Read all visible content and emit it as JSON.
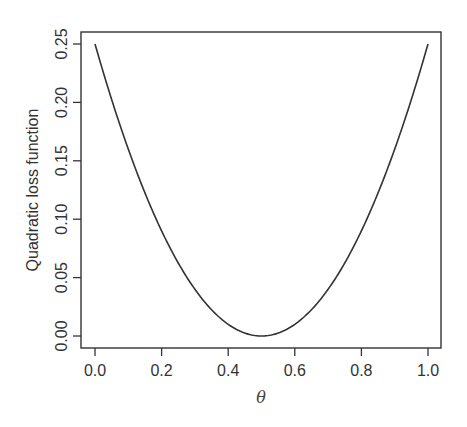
{
  "chart_data": {
    "type": "line",
    "title": "",
    "xlabel": "θ",
    "ylabel": "Quadratic loss function",
    "xlim": [
      0.0,
      1.0
    ],
    "ylim": [
      0.0,
      0.25
    ],
    "grid": false,
    "legend": null,
    "x_ticks": [
      "0.0",
      "0.2",
      "0.4",
      "0.6",
      "0.8",
      "1.0"
    ],
    "y_ticks": [
      "0.00",
      "0.05",
      "0.10",
      "0.15",
      "0.20",
      "0.25"
    ],
    "series": [
      {
        "name": "(θ - 0.5)^2",
        "color": "#333333",
        "x": [
          0.0,
          0.05,
          0.1,
          0.15,
          0.2,
          0.25,
          0.3,
          0.35,
          0.4,
          0.45,
          0.5,
          0.55,
          0.6,
          0.65,
          0.7,
          0.75,
          0.8,
          0.85,
          0.9,
          0.95,
          1.0
        ],
        "y": [
          0.25,
          0.2025,
          0.16,
          0.1225,
          0.09,
          0.0625,
          0.04,
          0.0225,
          0.01,
          0.0025,
          0.0,
          0.0025,
          0.01,
          0.0225,
          0.04,
          0.0625,
          0.09,
          0.1225,
          0.16,
          0.2025,
          0.25
        ]
      }
    ]
  }
}
